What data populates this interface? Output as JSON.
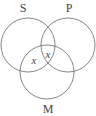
{
  "diagram": {
    "type": "venn",
    "sets": [
      {
        "label": "S",
        "cx": 28,
        "cy": 45,
        "r": 27
      },
      {
        "label": "P",
        "cx": 68,
        "cy": 45,
        "r": 27
      },
      {
        "label": "M",
        "cx": 47,
        "cy": 72,
        "r": 27
      }
    ],
    "marks": [
      {
        "text": "x",
        "region": "S∩M (not P)"
      },
      {
        "text": "x",
        "region": "S∩P∩M"
      }
    ],
    "stroke_color": "#777777",
    "text_color": "#444444"
  }
}
